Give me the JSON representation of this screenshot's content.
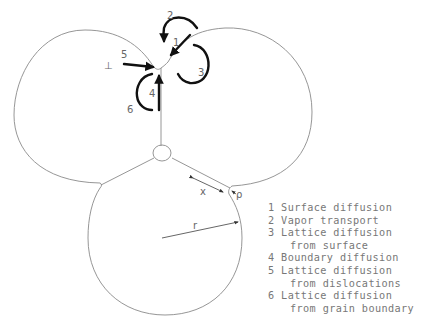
{
  "diagram": {
    "labels": {
      "n1": "1",
      "n2": "2",
      "n3": "3",
      "n4": "4",
      "n5": "5",
      "n6": "6",
      "dislocation": "⊥",
      "x": "x",
      "rho": "ρ",
      "r": "r"
    }
  },
  "legend": {
    "items": [
      {
        "num": "1",
        "line1": "Surface diffusion",
        "line2": ""
      },
      {
        "num": "2",
        "line1": "Vapor transport",
        "line2": ""
      },
      {
        "num": "3",
        "line1": "Lattice diffusion",
        "line2": "from surface"
      },
      {
        "num": "4",
        "line1": "Boundary diffusion",
        "line2": ""
      },
      {
        "num": "5",
        "line1": "Lattice diffusion",
        "line2": "from dislocations"
      },
      {
        "num": "6",
        "line1": "Lattice diffusion",
        "line2": "from grain boundary"
      }
    ]
  }
}
